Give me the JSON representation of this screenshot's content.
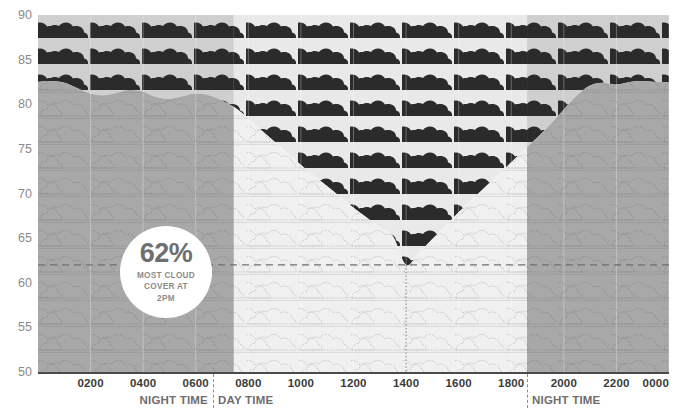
{
  "chart_data": {
    "type": "area",
    "title": "",
    "xlabel": "",
    "ylabel": "",
    "ylim": [
      50,
      90
    ],
    "xlim": [
      0,
      24
    ],
    "grid": true,
    "legend_position": "none",
    "y_ticks": [
      90,
      85,
      80,
      75,
      70,
      65,
      60,
      55,
      50
    ],
    "x_ticks": [
      "0200",
      "0400",
      "0600",
      "0800",
      "1000",
      "1200",
      "1400",
      "1600",
      "1800",
      "2000",
      "2200",
      "0000"
    ],
    "x_tick_hours": [
      2,
      4,
      6,
      8,
      10,
      12,
      14,
      16,
      18,
      20,
      22,
      24
    ],
    "series": [
      {
        "name": "Cloud cover",
        "x": [
          0,
          0.5,
          1,
          1.5,
          2,
          2.5,
          3,
          3.5,
          4,
          4.5,
          5,
          5.5,
          6,
          6.5,
          7,
          7.5,
          8,
          8.5,
          9,
          9.5,
          10,
          10.5,
          11,
          11.5,
          12,
          12.5,
          13,
          13.5,
          14,
          14.5,
          15,
          15.5,
          16,
          16.5,
          17,
          17.5,
          18,
          18.5,
          19,
          19.5,
          20,
          20.5,
          21,
          21.5,
          22,
          22.5,
          23,
          23.5,
          24
        ],
        "values": [
          82.5,
          82.6,
          82.4,
          81.8,
          81.2,
          81.0,
          81.3,
          81.6,
          81.4,
          80.8,
          80.6,
          80.9,
          81.2,
          81.0,
          80.4,
          79.6,
          78.4,
          77.1,
          75.8,
          74.5,
          73.2,
          72.0,
          70.8,
          69.6,
          68.4,
          67.3,
          66.2,
          65.2,
          62.0,
          63.4,
          64.9,
          66.4,
          67.9,
          69.3,
          70.7,
          72.1,
          73.5,
          74.9,
          76.3,
          77.8,
          79.4,
          81.0,
          82.1,
          82.4,
          82.2,
          82.5,
          82.6,
          82.5,
          82.5
        ]
      }
    ],
    "reference_line_y": 62,
    "reference_line_x_hour": 14,
    "regions": [
      {
        "label": "NIGHT TIME",
        "start_hour": 0,
        "end_hour": 7.45,
        "shade": "night"
      },
      {
        "label": "DAY TIME",
        "start_hour": 7.45,
        "end_hour": 18.6,
        "shade": "day"
      },
      {
        "label": "NIGHT TIME",
        "start_hour": 18.6,
        "end_hour": 24,
        "shade": "night"
      }
    ]
  },
  "axis": {
    "y_labels": [
      "90",
      "85",
      "80",
      "75",
      "70",
      "65",
      "60",
      "55",
      "50"
    ],
    "x_labels": [
      "0200",
      "0400",
      "0600",
      "0800",
      "1000",
      "1200",
      "1400",
      "1600",
      "1800",
      "2000",
      "2200",
      "0000"
    ]
  },
  "periods": [
    {
      "name": "night-time-early",
      "label": "NIGHT TIME"
    },
    {
      "name": "day-time",
      "label": "DAY TIME"
    },
    {
      "name": "night-time-late",
      "label": "NIGHT TIME"
    }
  ],
  "callout": {
    "percent": "62%",
    "line1": "MOST CLOUD",
    "line2": "COVER AT",
    "line3": "2PM"
  },
  "colors": {
    "cloud_dark": "#2b2b2b",
    "night_above": "#cfcfcf",
    "day_above": "#e6e6e6",
    "night_below": "#a8a8a8",
    "day_below": "#f0f0f0",
    "axis": "#4a4a4a",
    "y_label": "#8a8a8a",
    "x_label": "#3b3b3b",
    "badge_text": "#6f6f6f",
    "reference_line": "#8d8d8d"
  }
}
